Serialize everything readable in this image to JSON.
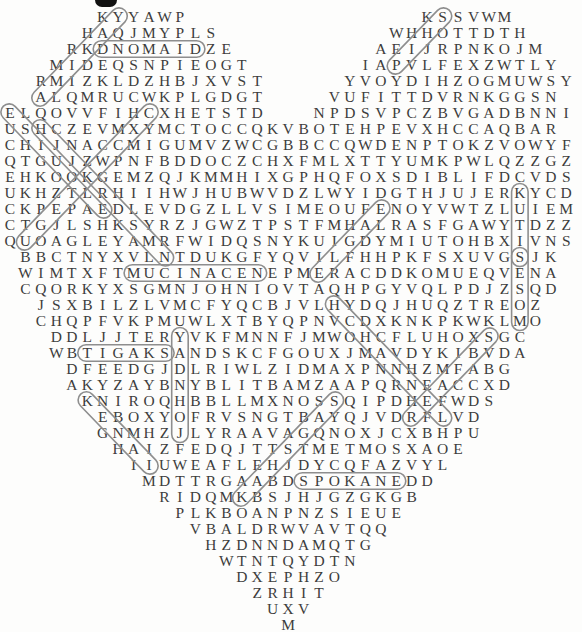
{
  "page": {
    "kind": "word-search-puzzle",
    "shape": "heart",
    "letter_color": "#3d3d3d",
    "capsule_color": "#8e8e8e",
    "background": "#fdfdfc"
  },
  "puzzle": {
    "rows": [
      {
        "r": 1,
        "segs": [
          [
            6,
            "KYYAWP"
          ],
          [
            27,
            "KSSVWM"
          ]
        ]
      },
      {
        "r": 2,
        "segs": [
          [
            5,
            "HAQJMYPLS"
          ],
          [
            25,
            "WHHOTTDTH"
          ]
        ]
      },
      {
        "r": 3,
        "segs": [
          [
            4,
            "RKDNOMAIDZE"
          ],
          [
            24,
            "AEIJRPNKOJM"
          ]
        ]
      },
      {
        "r": 4,
        "segs": [
          [
            3,
            "MIDEQSNPIEOGT"
          ],
          [
            23,
            "IAPVLFEXZWTLY"
          ]
        ]
      },
      {
        "r": 5,
        "segs": [
          [
            2,
            "RMIZKLDZHBJXVST"
          ],
          [
            22,
            "YVOYDIHZOGMUWSY"
          ]
        ]
      },
      {
        "r": 6,
        "segs": [
          [
            2,
            "ALQMRUCWKPLGDGT"
          ],
          [
            21,
            "VUFITTDVRNKGGSN"
          ]
        ]
      },
      {
        "r": 7,
        "segs": [
          [
            0,
            "ELQOVVFIHCXHETSTD"
          ],
          [
            20,
            "NPDSVPCZBVGADBNNI"
          ]
        ]
      },
      {
        "r": 8,
        "segs": [
          [
            0,
            "USHCZEVMXYMCTOCCQKVBOTEHPEVXHCCAQBAR"
          ]
        ]
      },
      {
        "r": 9,
        "segs": [
          [
            0,
            "CHIJNACCMIGUMVZWCGBBCCQWDENPTOKZVOWYF"
          ]
        ]
      },
      {
        "r": 10,
        "segs": [
          [
            0,
            "QTGUJZWPNFBDDOCZCHXFMLXTTYUMKPWLQZZGZ"
          ]
        ]
      },
      {
        "r": 11,
        "segs": [
          [
            0,
            "EHKOOKGEMZQJKMMHIXGPHQFOXSDIBLIFDCVDS"
          ]
        ]
      },
      {
        "r": 12,
        "segs": [
          [
            0,
            "UKHZTLRHIIHWJHUBWVDZLWYIDGTHJUJERKYCD"
          ]
        ]
      },
      {
        "r": 13,
        "segs": [
          [
            0,
            "CKPEPAEDLEVDGZLLVSIMEOUFENOYVWTZLUIEM"
          ]
        ]
      },
      {
        "r": 14,
        "segs": [
          [
            0,
            "CTGJLSHKSYRZJGWZTPSTFMHALRASFGAWYTDZZ"
          ]
        ]
      },
      {
        "r": 15,
        "segs": [
          [
            0,
            "QUOAGLEYAMRFWIDQSNYKUIGDYMIUTOHBXIVNS"
          ]
        ]
      },
      {
        "r": 16,
        "segs": [
          [
            1,
            "BBCTNYXVLNTDUKGFYQVILFHHPKFSXUVGSJK"
          ]
        ]
      },
      {
        "r": 17,
        "segs": [
          [
            1,
            "WIMTXFTMUCINACENEPMERACDDKOMUEQVENA"
          ]
        ]
      },
      {
        "r": 18,
        "segs": [
          [
            1,
            "CQORKYXSGMNJOHNIOVTAQHPGYVQLPDJZSQD"
          ]
        ]
      },
      {
        "r": 19,
        "segs": [
          [
            2,
            "JSXBILZLVMCFYQCBJVLHYDQJHUQZTREOZ"
          ]
        ]
      },
      {
        "r": 20,
        "segs": [
          [
            2,
            "CHQPFVKPMUWLXTBYQPNVCDXKNKPKWKLMO"
          ]
        ]
      },
      {
        "r": 21,
        "segs": [
          [
            3,
            "DDLJJTERYVKFMNNFJMWOHCFLUHOXSGC"
          ]
        ]
      },
      {
        "r": 22,
        "segs": [
          [
            3,
            "WBTIGAKSANDSKCFGOUXJMAVDYKIBVDA"
          ]
        ]
      },
      {
        "r": 23,
        "segs": [
          [
            4,
            "DFEEDGJDLRIWLZIDMAXPNNHZMFABG"
          ]
        ]
      },
      {
        "r": 24,
        "segs": [
          [
            4,
            "AKYZAYBNYBLITBAMZAAPQRNEACCXD"
          ]
        ]
      },
      {
        "r": 25,
        "segs": [
          [
            5,
            "KNIROQHBBLLMXNOSSQIPDHEFWDS"
          ]
        ]
      },
      {
        "r": 26,
        "segs": [
          [
            6,
            "EBOXYOFRVSNGTBAYQJVDRFLVD"
          ]
        ]
      },
      {
        "r": 27,
        "segs": [
          [
            6,
            "GNMHZJLYRAAVAGQNOXJCXBHPU"
          ]
        ]
      },
      {
        "r": 28,
        "segs": [
          [
            7,
            "HAIZFEDQJTTSTMETMOSXAOE"
          ]
        ]
      },
      {
        "r": 29,
        "segs": [
          [
            8,
            "IIUWEAFLEHJDYCQFAZVYL"
          ]
        ]
      },
      {
        "r": 30,
        "segs": [
          [
            9,
            "MDTTRGAABDSPOKANEDD"
          ]
        ]
      },
      {
        "r": 31,
        "segs": [
          [
            10,
            "RIDQMKBSJHJGZGKGB"
          ]
        ]
      },
      {
        "r": 32,
        "segs": [
          [
            11,
            "PLKBOANPNZSIEUE"
          ]
        ]
      },
      {
        "r": 33,
        "segs": [
          [
            12,
            "VBALDRWVAVTQQ"
          ]
        ]
      },
      {
        "r": 34,
        "segs": [
          [
            13,
            "HZDNNDAMQTG"
          ]
        ]
      },
      {
        "r": 35,
        "segs": [
          [
            14,
            "WTNTQYDTN"
          ]
        ]
      },
      {
        "r": 36,
        "segs": [
          [
            15,
            "DXEPHZO"
          ]
        ]
      },
      {
        "r": 37,
        "segs": [
          [
            16,
            "ZRHIT"
          ]
        ]
      },
      {
        "r": 38,
        "segs": [
          [
            17,
            "UXV"
          ]
        ]
      },
      {
        "r": 39,
        "segs": [
          [
            18,
            "M"
          ]
        ]
      }
    ],
    "circled_words": [
      {
        "name": "yakima",
        "letters_shown": "YAKIMA",
        "from": [
          1,
          7
        ],
        "to": [
          6,
          2
        ]
      },
      {
        "name": "ship",
        "letters_shown": "SHIP",
        "from": [
          1,
          28
        ],
        "to": [
          4,
          25
        ]
      },
      {
        "name": "diamond-reversed",
        "letters_shown": "DNOMAID",
        "from": [
          3,
          6
        ],
        "to": [
          3,
          12
        ]
      },
      {
        "name": "elouise-reversed",
        "letters_shown": "ESIUOLE",
        "from": [
          7,
          0
        ],
        "to": [
          13,
          6
        ]
      },
      {
        "name": "capsule-left-parallel",
        "letters_shown": "HJJKRDSMN",
        "from": [
          8,
          2
        ],
        "to": [
          16,
          10
        ]
      },
      {
        "name": "capsule-left-cross",
        "letters_shown": "CXCWKTEGU",
        "from": [
          7,
          9
        ],
        "to": [
          15,
          1
        ]
      },
      {
        "name": "situk-reversed",
        "letters_shown": "KUTIS",
        "from": [
          12,
          33
        ],
        "to": [
          16,
          33
        ]
      },
      {
        "name": "moses-reversed",
        "letters_shown": "SESOM",
        "from": [
          16,
          33
        ],
        "to": [
          20,
          33
        ]
      },
      {
        "name": "eagle",
        "letters_shown": "EAGLE",
        "from": [
          13,
          24
        ],
        "to": [
          17,
          20
        ]
      },
      {
        "name": "necanicum-reversed",
        "letters_shown": "MUCINACEN",
        "from": [
          17,
          8
        ],
        "to": [
          17,
          16
        ]
      },
      {
        "name": "channel",
        "letters_shown": "HCHANNEL",
        "from": [
          19,
          21
        ],
        "to": [
          26,
          28
        ]
      },
      {
        "name": "john-day-reversed",
        "letters_shown": "YADNHOJ",
        "from": [
          21,
          11
        ],
        "to": [
          27,
          11
        ]
      },
      {
        "name": "skagit-reversed",
        "letters_shown": "TIGAKS",
        "from": [
          22,
          5
        ],
        "to": [
          22,
          10
        ]
      },
      {
        "name": "kenai",
        "letters_shown": "KENAI",
        "from": [
          25,
          5
        ],
        "to": [
          29,
          9
        ]
      },
      {
        "name": "capsule-right-diag",
        "letters_shown": "SAGSHAK",
        "from": [
          25,
          21
        ],
        "to": [
          31,
          15
        ]
      },
      {
        "name": "spokane",
        "letters_shown": "SPOKANE",
        "from": [
          30,
          19
        ],
        "to": [
          30,
          25
        ]
      },
      {
        "name": "capsule-right-cross",
        "letters_shown": "SBFAER",
        "from": [
          21,
          31
        ],
        "to": [
          26,
          26
        ]
      }
    ]
  }
}
